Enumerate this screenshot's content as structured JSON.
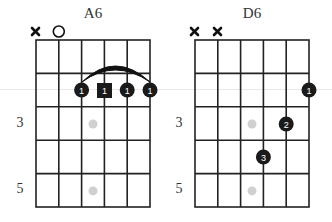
{
  "charts": [
    {
      "name": "A6",
      "title": "A6",
      "string_markers": [
        "mute",
        "open",
        null,
        null,
        null,
        null
      ],
      "fret_labels": [
        {
          "fret": 3,
          "label": "3"
        },
        {
          "fret": 5,
          "label": "5"
        }
      ],
      "inlays": [
        3,
        5
      ],
      "barre": {
        "fret": 2,
        "from_string": 3,
        "to_string": 6
      },
      "fingers": [
        {
          "string": 3,
          "fret": 2,
          "finger": "1",
          "shape": "circle"
        },
        {
          "string": 4,
          "fret": 2,
          "finger": "1",
          "shape": "square"
        },
        {
          "string": 5,
          "fret": 2,
          "finger": "1",
          "shape": "circle"
        },
        {
          "string": 6,
          "fret": 2,
          "finger": "1",
          "shape": "circle"
        }
      ]
    },
    {
      "name": "D6",
      "title": "D6",
      "string_markers": [
        "mute",
        "mute",
        null,
        null,
        null,
        null
      ],
      "fret_labels": [
        {
          "fret": 3,
          "label": "3"
        },
        {
          "fret": 5,
          "label": "5"
        }
      ],
      "inlays": [
        3,
        5
      ],
      "barre": null,
      "fingers": [
        {
          "string": 6,
          "fret": 2,
          "finger": "1",
          "shape": "circle"
        },
        {
          "string": 5,
          "fret": 3,
          "finger": "2",
          "shape": "circle"
        },
        {
          "string": 4,
          "fret": 4,
          "finger": "3",
          "shape": "circle"
        }
      ]
    }
  ],
  "colors": {
    "grid": "#222222",
    "dot": "#1a1a1a",
    "dot_text": "#ffffff",
    "inlay": "#d0d0d0",
    "text": "#333333"
  }
}
